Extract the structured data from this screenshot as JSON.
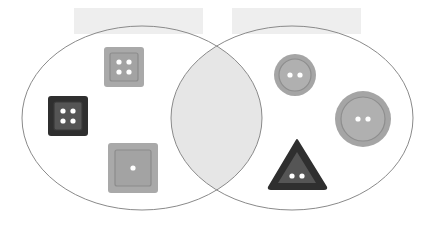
{
  "diagram": {
    "type": "venn",
    "labels": [
      {
        "id": "left",
        "text": "",
        "x": 74,
        "y": 8,
        "w": 129,
        "h": 26
      },
      {
        "id": "right",
        "text": "",
        "x": 232,
        "y": 8,
        "w": 129,
        "h": 26
      }
    ],
    "sets": [
      {
        "id": "left-set",
        "cx": 142,
        "cy": 118,
        "rx": 120,
        "ry": 92
      },
      {
        "id": "right-set",
        "cx": 292,
        "cy": 118,
        "rx": 121,
        "ry": 92
      }
    ],
    "intersection_fill": "#e6e6e6",
    "outline_color": "#8a8a8a",
    "items": [
      {
        "name": "square-button-light-4-holes",
        "shape": "square",
        "set": "left",
        "x": 104,
        "y": 47,
        "size": 40,
        "holes": 4,
        "outer": "#a9a9a9",
        "inner": "#a0a0a0",
        "ring": "#8c8c8c"
      },
      {
        "name": "square-button-dark-4-holes",
        "shape": "square",
        "set": "left",
        "x": 48,
        "y": 96,
        "size": 40,
        "holes": 4,
        "outer": "#2f2f2f",
        "inner": "#555555",
        "ring": "#3a3a3a"
      },
      {
        "name": "square-button-large-1-hole",
        "shape": "square",
        "set": "left",
        "x": 108,
        "y": 143,
        "size": 50,
        "holes": 1,
        "outer": "#a9a9a9",
        "inner": "#a3a3a3",
        "ring": "#8c8c8c"
      },
      {
        "name": "round-button-small-2-holes",
        "shape": "circle",
        "set": "right",
        "cx": 295,
        "cy": 75,
        "r": 21,
        "holes": 2,
        "outer": "#a5a5a5",
        "inner": "#b0b0b0",
        "ring": "#8e8e8e"
      },
      {
        "name": "round-button-large-2-holes",
        "shape": "circle",
        "set": "right",
        "cx": 363,
        "cy": 119,
        "r": 28,
        "holes": 2,
        "outer": "#a5a5a5",
        "inner": "#b0b0b0",
        "ring": "#8e8e8e"
      },
      {
        "name": "triangle-button-dark-2-holes",
        "shape": "triangle",
        "set": "right",
        "apex": [
          297,
          140
        ],
        "base": [
          [
            270,
            188
          ],
          [
            326,
            188
          ]
        ],
        "holes": 2,
        "outer": "#2f2f2f",
        "inner": "#555555"
      }
    ]
  }
}
